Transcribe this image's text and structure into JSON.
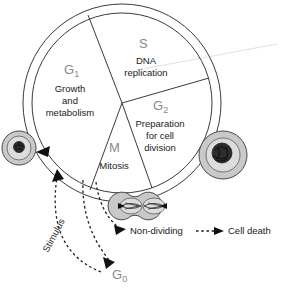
{
  "diagram": {
    "phases": [
      {
        "id": "g1",
        "label": "G",
        "subscript": "1",
        "description_lines": [
          "Growth",
          "and",
          "metabolism"
        ]
      },
      {
        "id": "s",
        "label": "S",
        "subscript": "",
        "description_lines": [
          "DNA",
          "replication"
        ]
      },
      {
        "id": "g2",
        "label": "G",
        "subscript": "2",
        "description_lines": [
          "Preparation",
          "for cell",
          "division"
        ]
      },
      {
        "id": "m",
        "label": "M",
        "subscript": "",
        "description_lines": [
          "Mitosis"
        ]
      }
    ],
    "exit_states": {
      "quiescent_label": "G",
      "quiescent_subscript": "0",
      "stimulus_label": "Stimulus",
      "non_dividing_label": "Non-dividing",
      "cell_death_label": "Cell death"
    },
    "cells": {
      "interphase_cell_name": "interphase-cell",
      "condensed_cell_name": "condensed-chromatin-cell",
      "dividing_cell_name": "dividing-cell"
    },
    "colors": {
      "phase_label": "#8a8a8a",
      "description_text": "#1a1a1a",
      "ring_stroke": "#3b3b3b",
      "cell_fill": "#c9c9c9",
      "cell_inner_fill": "#dcdcdc",
      "nucleus": "#2d2d2d",
      "background": "#ffffff"
    }
  }
}
